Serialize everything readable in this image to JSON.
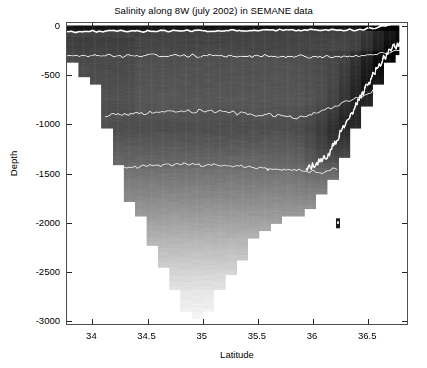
{
  "figure": {
    "title": "Salinity along 8W (july 2002) in SEMANE data",
    "background_color": "#ffffff",
    "axis_color": "#4d4d4d"
  },
  "axes": {
    "xlabel": "Latitude",
    "ylabel": "Depth",
    "xticks": [
      34,
      34.5,
      35,
      35.5,
      36,
      36.5
    ],
    "xticklabels": [
      "34",
      "34.5",
      "35",
      "35.5",
      "36",
      "36.5"
    ],
    "yticks": [
      0,
      -500,
      -1000,
      -1500,
      -2000,
      -2500,
      -3000
    ],
    "yticklabels": [
      "0",
      "-500",
      "-1000",
      "-1500",
      "-2000",
      "-2500",
      "-3000"
    ],
    "xlim": [
      33.77,
      36.87
    ],
    "ylim": [
      -3050,
      30
    ],
    "box": true,
    "tick_direction": "in"
  },
  "chart_data": {
    "type": "heatmap",
    "title": "Salinity along 8W (july 2002) in SEMANE data",
    "xlabel": "Latitude",
    "ylabel": "Depth",
    "xlim": [
      33.77,
      36.87
    ],
    "ylim": [
      -3050,
      30
    ],
    "grid": false,
    "legend": "none",
    "colormap": "gray",
    "colorbar": false,
    "variable": "Salinity",
    "x": [
      33.85,
      33.95,
      34.05,
      34.15,
      34.25,
      34.35,
      34.45,
      34.55,
      34.65,
      34.75,
      34.85,
      34.95,
      35.05,
      35.15,
      35.25,
      35.35,
      35.45,
      35.55,
      35.65,
      35.75,
      35.85,
      35.95,
      36.05,
      36.15,
      36.25,
      36.35,
      36.45,
      36.55,
      36.65,
      36.75
    ],
    "depth_levels": [
      0,
      -50,
      -100,
      -200,
      -300,
      -500,
      -750,
      -1000,
      -1250,
      -1500,
      -1750,
      -2000,
      -2250,
      -2500,
      -2750,
      -3000
    ],
    "contour_lines": [
      {
        "label": "upper salinity maximum boundary",
        "approx_depth": -60,
        "color": "#ffffff"
      },
      {
        "label": "intermediate boundary",
        "approx_depth": -320,
        "color": "#f2f2f2"
      },
      {
        "label": "mid boundary",
        "approx_depth": -900,
        "color": "#f2f2f2"
      },
      {
        "label": "lower boundary",
        "approx_depth": -1450,
        "color": "#f2f2f2"
      },
      {
        "label": "eastern slope boundary",
        "approx_depth": -1100,
        "color": "#ffffff"
      }
    ],
    "bathymetry": {
      "description": "Stepped seabed: shallow shelf at southern (left) edge near -350 m, deepening to a V-shaped basin reaching about -3000 m near latitude 35.0, and rising steeply on the northern (right) slope to about -300 m at 36.8",
      "points": [
        {
          "lat": 33.85,
          "depth": -350
        },
        {
          "lat": 33.95,
          "depth": -620
        },
        {
          "lat": 34.05,
          "depth": -620
        },
        {
          "lat": 34.15,
          "depth": -1180
        },
        {
          "lat": 34.25,
          "depth": -1500
        },
        {
          "lat": 34.35,
          "depth": -1800
        },
        {
          "lat": 34.45,
          "depth": -2000
        },
        {
          "lat": 34.55,
          "depth": -2250
        },
        {
          "lat": 34.65,
          "depth": -2500
        },
        {
          "lat": 34.75,
          "depth": -2700
        },
        {
          "lat": 34.85,
          "depth": -2900
        },
        {
          "lat": 34.95,
          "depth": -3000
        },
        {
          "lat": 35.05,
          "depth": -2950
        },
        {
          "lat": 35.15,
          "depth": -2700
        },
        {
          "lat": 35.25,
          "depth": -2550
        },
        {
          "lat": 35.35,
          "depth": -2400
        },
        {
          "lat": 35.45,
          "depth": -2250
        },
        {
          "lat": 35.55,
          "depth": -2100
        },
        {
          "lat": 35.65,
          "depth": -2050
        },
        {
          "lat": 35.75,
          "depth": -1950
        },
        {
          "lat": 35.85,
          "depth": -2000
        },
        {
          "lat": 35.95,
          "depth": -1900
        },
        {
          "lat": 36.05,
          "depth": -1800
        },
        {
          "lat": 36.15,
          "depth": -1700
        },
        {
          "lat": 36.25,
          "depth": -1450
        },
        {
          "lat": 36.35,
          "depth": -1200
        },
        {
          "lat": 36.45,
          "depth": -950
        },
        {
          "lat": 36.55,
          "depth": -700
        },
        {
          "lat": 36.65,
          "depth": -480
        },
        {
          "lat": 36.75,
          "depth": -300
        }
      ]
    },
    "shading_scale": {
      "description": "Grayscale value by depth band — darkest (high salinity) at the surface layer, lightening monotonically with depth",
      "bands": [
        {
          "depth_top": 0,
          "depth_bottom": -55,
          "gray": "#0d0d0d"
        },
        {
          "depth_top": -55,
          "depth_bottom": -300,
          "gray": "#4a4a4a"
        },
        {
          "depth_top": -300,
          "depth_bottom": -700,
          "gray": "#575757"
        },
        {
          "depth_top": -700,
          "depth_bottom": -1000,
          "gray": "#5e5e5e"
        },
        {
          "depth_top": -1000,
          "depth_bottom": -1450,
          "gray": "#4f4f4f"
        },
        {
          "depth_top": -1450,
          "depth_bottom": -1800,
          "gray": "#737373"
        },
        {
          "depth_top": -1800,
          "depth_bottom": -2100,
          "gray": "#8f8f8f"
        },
        {
          "depth_top": -2100,
          "depth_bottom": -2400,
          "gray": "#b0b0b0"
        },
        {
          "depth_top": -2400,
          "depth_bottom": -2700,
          "gray": "#d2d2d2"
        },
        {
          "depth_top": -2700,
          "depth_bottom": -3050,
          "gray": "#eeeeee"
        }
      ]
    },
    "markers": [
      {
        "lat": 35.6,
        "depth": -1470,
        "style": "white-dot"
      },
      {
        "lat": 36.24,
        "depth": -2020,
        "style": "dark-square"
      }
    ]
  }
}
